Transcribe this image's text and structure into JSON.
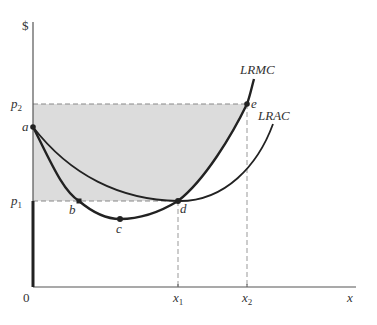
{
  "diagram": {
    "type": "economics-cost-curves",
    "colors": {
      "shade": "#dcdcdc",
      "curve": "#222222",
      "axis": "#555555",
      "dash": "#888888",
      "text": "#333333"
    },
    "axes": {
      "y_label": "$",
      "x_label": "x",
      "origin_label": "0"
    },
    "y_ticks": [
      {
        "label": "p",
        "sub": "2"
      },
      {
        "label": "p",
        "sub": "1"
      }
    ],
    "x_ticks": [
      {
        "label": "x",
        "sub": "1"
      },
      {
        "label": "x",
        "sub": "2"
      }
    ],
    "curves": [
      {
        "name": "LRMC",
        "label": "LRMC"
      },
      {
        "name": "LRAC",
        "label": "LRAC"
      }
    ],
    "points": [
      {
        "label": "a"
      },
      {
        "label": "b"
      },
      {
        "label": "c"
      },
      {
        "label": "d"
      },
      {
        "label": "e"
      }
    ]
  }
}
